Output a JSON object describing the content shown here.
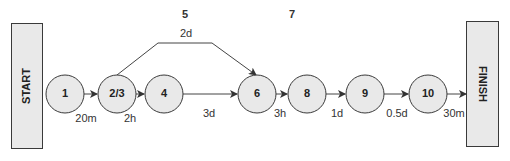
{
  "colors": {
    "node_fill": "#e9e9e9",
    "node_stroke": "#3a3a3a",
    "edge": "#444444",
    "text": "#222222"
  },
  "terminals": {
    "start": {
      "label": "START",
      "x": 11,
      "y": 23,
      "w": 31,
      "h": 125
    },
    "finish": {
      "label": "FINISH",
      "x": 466,
      "y": 21,
      "w": 32,
      "h": 125
    }
  },
  "nodes": [
    {
      "id": "1",
      "label": "1",
      "cx": 65,
      "cy": 94
    },
    {
      "id": "2/3",
      "label": "2/3",
      "cx": 117,
      "cy": 94
    },
    {
      "id": "4",
      "label": "4",
      "cx": 164,
      "cy": 94
    },
    {
      "id": "6",
      "label": "6",
      "cx": 257,
      "cy": 94
    },
    {
      "id": "8",
      "label": "8",
      "cx": 307,
      "cy": 94
    },
    {
      "id": "9",
      "label": "9",
      "cx": 365,
      "cy": 94
    },
    {
      "id": "10",
      "label": "10",
      "cx": 428,
      "cy": 94
    }
  ],
  "edges": [
    {
      "from": "1",
      "to": "2/3",
      "duration": "20m"
    },
    {
      "from": "2/3",
      "to": "4",
      "duration": "2h"
    },
    {
      "from": "4",
      "to": "6",
      "duration": "3d"
    },
    {
      "from": "2/3",
      "to": "6",
      "duration": "2d",
      "label_above": "5"
    },
    {
      "from": "6",
      "to": "8",
      "duration": "3h"
    },
    {
      "from": "8",
      "to": "9",
      "duration": "1d"
    },
    {
      "from": "9",
      "to": "10",
      "duration": "0.5d"
    },
    {
      "from": "10",
      "to": "FINISH",
      "duration": "30m"
    }
  ],
  "labels": {
    "activity_5": "5",
    "activity_7": "7",
    "d_20m": "20m",
    "d_2h": "2h",
    "d_3d": "3d",
    "d_2d": "2d",
    "d_3h": "3h",
    "d_1d": "1d",
    "d_05d": "0.5d",
    "d_30m": "30m"
  }
}
